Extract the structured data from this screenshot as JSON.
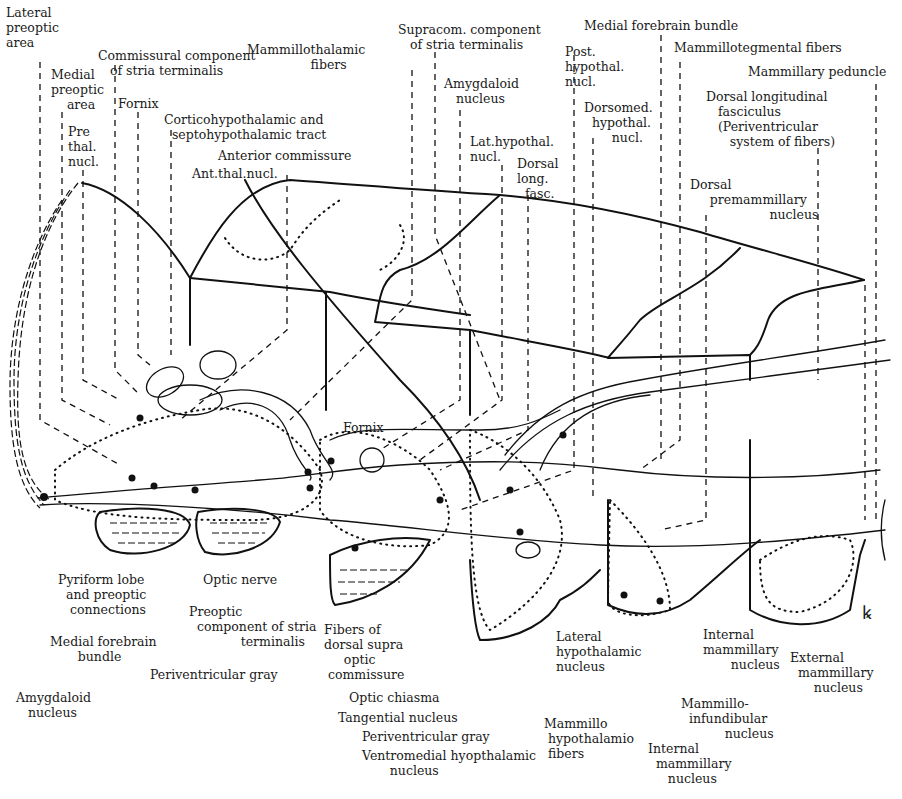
{
  "diagram": {
    "type": "anatomical-line-drawing",
    "signature_glyph": "ꝃ"
  },
  "labels_top": [
    {
      "id": "lateral-preoptic-area",
      "text": "Lateral\npreoptic\narea",
      "x": 6,
      "y": 5
    },
    {
      "id": "commissural-component-stria",
      "text": "Commissural component\n   of stria terminalis",
      "x": 98,
      "y": 48
    },
    {
      "id": "medial-preoptic-area",
      "text": "Medial\npreoptic\n    area",
      "x": 51,
      "y": 67
    },
    {
      "id": "fornix-top",
      "text": "Fornix",
      "x": 118,
      "y": 96
    },
    {
      "id": "pre-thal-nucl",
      "text": "Pre\nthal.\nnucl.",
      "x": 68,
      "y": 124
    },
    {
      "id": "corticohypothalamic-tract",
      "text": "Corticohypothalamic and\n  septohypothalamic tract",
      "x": 164,
      "y": 112
    },
    {
      "id": "anterior-commissure",
      "text": "Anterior commissure",
      "x": 218,
      "y": 148
    },
    {
      "id": "ant-thal-nucl",
      "text": "Ant.thal.nucl.",
      "x": 192,
      "y": 166
    },
    {
      "id": "mammillothalamic-fibers",
      "text": "Mammillothalamic\n                fibers",
      "x": 247,
      "y": 42
    },
    {
      "id": "supracom-component-stria",
      "text": "Supracom. component\n   of stria terminalis",
      "x": 398,
      "y": 22
    },
    {
      "id": "amygdaloid-nucleus-top",
      "text": "Amygdaloid\n   nucleus",
      "x": 444,
      "y": 76
    },
    {
      "id": "lat-hypothal-nucl",
      "text": "Lat.hypothal.\nnucl.",
      "x": 470,
      "y": 134
    },
    {
      "id": "dorsal-long-fasc",
      "text": "Dorsal\nlong.\n  fasc.",
      "x": 517,
      "y": 156
    },
    {
      "id": "medial-forebrain-bundle-top",
      "text": "Medial forebrain bundle",
      "x": 584,
      "y": 18
    },
    {
      "id": "post-hypothal-nucl",
      "text": "Post.\nhypothal.\nnucl.",
      "x": 565,
      "y": 44
    },
    {
      "id": "dorsomed-hypothal-nucl",
      "text": "Dorsomed.\n  hypothal.\n       nucl.",
      "x": 584,
      "y": 100
    },
    {
      "id": "mammillotegmental-fibers",
      "text": "Mammillotegmental fibers",
      "x": 674,
      "y": 40
    },
    {
      "id": "mammillary-peduncle",
      "text": "Mammillary peduncle",
      "x": 748,
      "y": 64
    },
    {
      "id": "dorsal-longitudinal-fasciculus",
      "text": "Dorsal longitudinal\n   fasciculus\n   (Periventricular\n      system of fibers)",
      "x": 706,
      "y": 89
    },
    {
      "id": "dorsal-premammillary-nucleus",
      "text": "Dorsal\n     premammillary\n                    nucleus",
      "x": 690,
      "y": 177
    }
  ],
  "labels_mid": [
    {
      "id": "fornix-mid",
      "text": "Fornix",
      "x": 343,
      "y": 420
    }
  ],
  "labels_bottom": [
    {
      "id": "pyriform-lobe",
      "text": "Pyriform lobe\n  and preoptic\n   connections",
      "x": 58,
      "y": 572
    },
    {
      "id": "optic-nerve",
      "text": "Optic nerve",
      "x": 203,
      "y": 572
    },
    {
      "id": "preoptic-component-stria",
      "text": "Preoptic\n  component of stria\n             terminalis",
      "x": 189,
      "y": 604
    },
    {
      "id": "medial-forebrain-bundle-bottom",
      "text": "Medial forebrain\n       bundle",
      "x": 50,
      "y": 634
    },
    {
      "id": "periventricular-gray-left",
      "text": "Periventricular gray",
      "x": 150,
      "y": 667
    },
    {
      "id": "amygdaloid-nucleus-bottom",
      "text": "Amygdaloid\n   nucleus",
      "x": 16,
      "y": 690
    },
    {
      "id": "fibers-dorsal-supraoptic",
      "text": "Fibers of\ndorsal supra\n     optic\n commissure",
      "x": 324,
      "y": 622
    },
    {
      "id": "optic-chiasma",
      "text": "Optic chiasma",
      "x": 349,
      "y": 690
    },
    {
      "id": "tangential-nucleus",
      "text": "Tangential nucleus",
      "x": 338,
      "y": 710
    },
    {
      "id": "periventricular-gray-center",
      "text": "Periventricular gray",
      "x": 362,
      "y": 729
    },
    {
      "id": "ventromedial-hypothalamic-nucleus",
      "text": "Ventromedial hyopthalamic\n       nucleus",
      "x": 362,
      "y": 748
    },
    {
      "id": "lateral-hypothalamic-nucleus",
      "text": "Lateral\nhypothalamic\nnucleus",
      "x": 556,
      "y": 629
    },
    {
      "id": "mammillo-hypothalamio-fibers",
      "text": "Mammillo\n hypothalamio\n fibers",
      "x": 544,
      "y": 716
    },
    {
      "id": "internal-mammillary-nucleus-upper",
      "text": "Internal\nmammillary\n       nucleus",
      "x": 703,
      "y": 627
    },
    {
      "id": "external-mammillary-nucleus",
      "text": "External\n  mammillary\n      nucleus",
      "x": 790,
      "y": 650
    },
    {
      "id": "mammillo-infundibular-nucleus",
      "text": "Mammillo-\n  infundibular\n           nucleus",
      "x": 681,
      "y": 696
    },
    {
      "id": "internal-mammillary-nucleus-lower",
      "text": "Internal\n  mammillary\n     nucleus",
      "x": 648,
      "y": 741
    }
  ]
}
